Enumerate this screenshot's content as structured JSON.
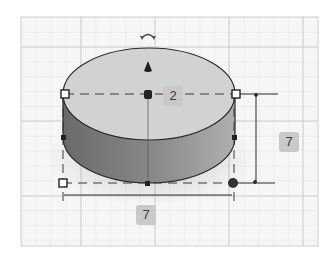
{
  "workplane": {
    "grid_color": "#dcdcdc",
    "major_grid_color": "#c8c8c8",
    "frame_color": "#cfcfcf"
  },
  "shape": {
    "type": "cylinder",
    "top_color": "#cfcfcf",
    "side_color_dark": "#6e6e6e",
    "side_color_light": "#a8a8a8",
    "outline_color": "#2a2a2a"
  },
  "dimensions": {
    "elevation_label": "2",
    "height_label": "7",
    "width_label": "7"
  },
  "icons": {
    "rotate": "rotate-arrow-icon",
    "lift": "lift-cone-icon"
  }
}
